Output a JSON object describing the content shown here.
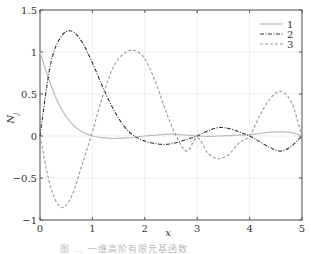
{
  "chart_data": {
    "type": "line",
    "title": "",
    "xlabel": "x",
    "ylabel": "N_j",
    "xlim": [
      0,
      5
    ],
    "ylim": [
      -1,
      1.5
    ],
    "grid": true,
    "legend_position": "upper right",
    "x_ticks": [
      "0",
      "1",
      "2",
      "3",
      "4",
      "5"
    ],
    "y_ticks": [
      "−1",
      "−0.5",
      "0",
      "0.5",
      "1",
      "1.5"
    ],
    "x": [
      0,
      0.2,
      0.4,
      0.6,
      0.8,
      1.0,
      1.2,
      1.4,
      1.6,
      1.8,
      2.0,
      2.2,
      2.4,
      2.6,
      2.8,
      3.0,
      3.2,
      3.4,
      3.6,
      3.8,
      4.0,
      4.2,
      4.4,
      4.6,
      4.8,
      5.0
    ],
    "series": [
      {
        "name": "1",
        "style": "solid",
        "color": "#bbbbbb",
        "values": [
          1.0,
          0.62,
          0.33,
          0.15,
          0.05,
          0.0,
          -0.02,
          -0.03,
          -0.025,
          -0.015,
          0.0,
          0.01,
          0.02,
          0.02,
          0.01,
          0.0,
          -0.005,
          0.0,
          0.005,
          0.01,
          0.015,
          0.03,
          0.045,
          0.05,
          0.04,
          0.0
        ]
      },
      {
        "name": "2",
        "style": "dashdot",
        "color": "#333333",
        "values": [
          0.0,
          0.85,
          1.18,
          1.25,
          1.12,
          0.87,
          0.58,
          0.32,
          0.12,
          0.0,
          -0.06,
          -0.09,
          -0.1,
          -0.08,
          -0.04,
          0.0,
          0.06,
          0.1,
          0.09,
          0.05,
          0.0,
          -0.07,
          -0.14,
          -0.18,
          -0.12,
          0.0
        ]
      },
      {
        "name": "3",
        "style": "dashed",
        "color": "#999999",
        "values": [
          0.0,
          -0.6,
          -0.85,
          -0.72,
          -0.35,
          0.05,
          0.48,
          0.82,
          0.98,
          1.02,
          0.92,
          0.65,
          0.3,
          0.0,
          -0.18,
          -0.02,
          -0.2,
          -0.27,
          -0.22,
          -0.08,
          0.0,
          0.25,
          0.45,
          0.53,
          0.4,
          0.0
        ]
      }
    ]
  },
  "caption": "图 … 一维高阶有限元基函数"
}
